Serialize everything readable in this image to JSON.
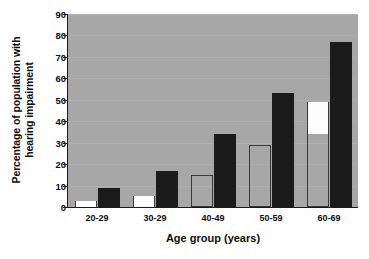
{
  "chart_data": {
    "type": "bar",
    "title": "",
    "subtitle": "",
    "xlabel": "Age group (years)",
    "ylabel": "Percentage of population with hearing impairment",
    "ylabel_line1": "Percentage of population with",
    "ylabel_line2": "hearing impairment",
    "categories": [
      "20-29",
      "30-29",
      "40-49",
      "50-59",
      "60-69"
    ],
    "series": [
      {
        "name": "open-bar-series",
        "style": "open-outlined",
        "values": [
          3,
          5,
          15,
          29,
          49
        ]
      },
      {
        "name": "dark-bar-series",
        "style": "solid-black",
        "values": [
          9,
          17,
          34,
          53,
          77
        ]
      }
    ],
    "ylim": [
      0,
      90
    ],
    "ytick_step": 10,
    "yticks": [
      "0",
      "10",
      "20",
      "30",
      "40",
      "50",
      "60",
      "70",
      "80",
      "90"
    ],
    "grid": true,
    "grid_axis": "y",
    "legend": "none",
    "annotations": [
      {
        "note": "60-69 open bar is white-filled only between 34 and 49; lower portion matches plot background"
      }
    ],
    "open_bar_white_fill": [
      {
        "category": "20-29",
        "from": 0,
        "to": 3
      },
      {
        "category": "30-29",
        "from": 0,
        "to": 5
      },
      {
        "category": "40-49",
        "from": 0,
        "to": 0
      },
      {
        "category": "50-59",
        "from": 0,
        "to": 0
      },
      {
        "category": "60-69",
        "from": 34,
        "to": 49
      }
    ]
  },
  "colors": {
    "plot_background": "#a7a7a7",
    "gridline": "#b0b0b0",
    "dark_bar": "#1b1b1b",
    "open_bar_fill": "#fdfdfd",
    "open_bar_border": "#3a3a3a",
    "axis": "#1a1a1a",
    "text": "#0d0d0d",
    "page_background": "#ffffff"
  }
}
